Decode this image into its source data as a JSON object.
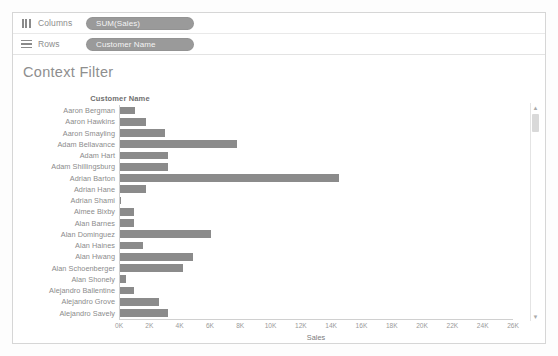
{
  "shelves": {
    "columns": {
      "label": "Columns",
      "icon": "columns-icon",
      "pill": "SUM(Sales)"
    },
    "rows": {
      "label": "Rows",
      "icon": "rows-icon",
      "pill": "Customer Name"
    }
  },
  "worksheet": {
    "title": "Context Filter",
    "row_field_caption": "Customer Name"
  },
  "scrollbar": {
    "up_arrow": "▲",
    "down_arrow": "▼"
  },
  "colors": {
    "bar": "#8b8b8b",
    "pill": "#9a9a9a",
    "axis": "#d0d0d0",
    "text": "#8b8b8b"
  },
  "chart_data": {
    "type": "bar",
    "orientation": "horizontal",
    "title": "Context Filter",
    "xlabel": "Sales",
    "ylabel": "Customer Name",
    "xlim": [
      0,
      26000
    ],
    "xticks": [
      0,
      2000,
      4000,
      6000,
      8000,
      10000,
      12000,
      14000,
      16000,
      18000,
      20000,
      22000,
      24000,
      26000
    ],
    "xticklabels": [
      "0K",
      "2K",
      "4K",
      "6K",
      "8K",
      "10K",
      "12K",
      "14K",
      "16K",
      "18K",
      "20K",
      "22K",
      "24K",
      "26K"
    ],
    "grid": false,
    "legend": false,
    "categories": [
      "Aaron Bergman",
      "Aaron Hawkins",
      "Aaron Smayling",
      "Adam Bellavance",
      "Adam Hart",
      "Adam Shillingsburg",
      "Adrian Barton",
      "Adrian Shami",
      "Adrian Hane",
      "Aimee Bixby",
      "Alan Barnes",
      "Alan Dominguez",
      "Alan Haines",
      "Alan Hwang",
      "Alan Schoenberger",
      "Alan Shonely",
      "Alejandro Ballentine",
      "Alejandro Grove",
      "Alejandro Savely"
    ],
    "rows": [
      {
        "label": "Aaron Bergman",
        "value": 1000
      },
      {
        "label": "Aaron Hawkins",
        "value": 1750
      },
      {
        "label": "Aaron Smayling",
        "value": 3000
      },
      {
        "label": "Adam Bellavance",
        "value": 7750
      },
      {
        "label": "Adam Hart",
        "value": 3200
      },
      {
        "label": "Adam Shillingsburg",
        "value": 3200
      },
      {
        "label": "Adrian Barton",
        "value": 14500
      },
      {
        "label": "Adrian Hane",
        "value": 1750
      },
      {
        "label": "Adrian Shami",
        "value": 60
      },
      {
        "label": "Aimee Bixby",
        "value": 950
      },
      {
        "label": "Alan Barnes",
        "value": 900
      },
      {
        "label": "Alan Dominguez",
        "value": 6000
      },
      {
        "label": "Alan Haines",
        "value": 1550
      },
      {
        "label": "Alan Hwang",
        "value": 4800
      },
      {
        "label": "Alan Schoenberger",
        "value": 4200
      },
      {
        "label": "Alan Shonely",
        "value": 400
      },
      {
        "label": "Alejandro Ballentine",
        "value": 900
      },
      {
        "label": "Alejandro Grove",
        "value": 2600
      },
      {
        "label": "Alejandro Savely",
        "value": 3200
      }
    ],
    "values": [
      1000,
      1750,
      3000,
      7750,
      3200,
      3200,
      14500,
      1750,
      60,
      950,
      900,
      6000,
      1550,
      4800,
      4200,
      400,
      900,
      2600,
      3200
    ]
  }
}
